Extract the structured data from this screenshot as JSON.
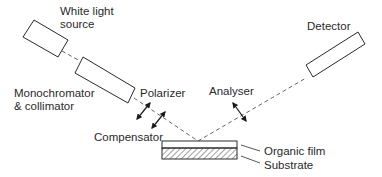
{
  "diagram": {
    "type": "ellipsometer-setup",
    "labels": {
      "white_light_source_line1": "White light",
      "white_light_source_line2": "source",
      "monochromator_line1": "Monochromator",
      "monochromator_line2": "& collimator",
      "polarizer": "Polarizer",
      "compensator": "Compensator",
      "analyser": "Analyser",
      "detector": "Detector",
      "organic_film": "Organic film",
      "substrate": "Substrate"
    },
    "colors": {
      "stroke": "#2a2a2a",
      "beam": "#555555",
      "background": "#ffffff"
    }
  }
}
